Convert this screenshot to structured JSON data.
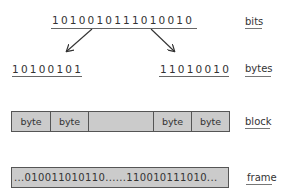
{
  "diagram": {
    "bits": {
      "value": "1010010111010010",
      "label": "bits"
    },
    "bytes": {
      "left": "10100101",
      "right": "11010010",
      "label": "bytes"
    },
    "block": {
      "cells": [
        "byte",
        "byte",
        "",
        "byte",
        "byte"
      ],
      "label": "block"
    },
    "frame": {
      "value": "...010011010110......110010111010...",
      "label": "frame"
    },
    "colors": {
      "bar_fill": "#cbcbcb",
      "bar_border": "#555555",
      "text": "#333333"
    }
  }
}
